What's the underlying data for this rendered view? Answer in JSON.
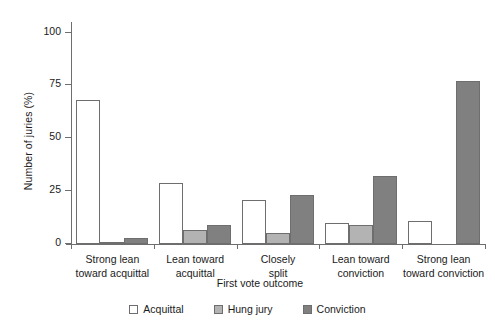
{
  "chart_data": {
    "type": "bar",
    "title": "",
    "xlabel": "First vote outcome",
    "ylabel": "Number of juries (%)",
    "ylim": [
      0,
      105
    ],
    "yticks": [
      0,
      25,
      50,
      75,
      100
    ],
    "ytick_labels": [
      "0",
      "25",
      "50",
      "75",
      "100"
    ],
    "grid": false,
    "legend_position": "bottom-center",
    "categories": [
      "Strong lean\ntoward acquittal",
      "Lean toward\nacquittal",
      "Closely\nsplit",
      "Lean toward\nconviction",
      "Strong lean\ntoward conviction"
    ],
    "category_lines": [
      [
        "Strong lean",
        "toward acquittal"
      ],
      [
        "Lean toward",
        "acquittal"
      ],
      [
        "Closely",
        "split"
      ],
      [
        "Lean toward",
        "conviction"
      ],
      [
        "Strong lean",
        "toward conviction"
      ]
    ],
    "series": [
      {
        "name": "Acquittal",
        "color": "#ffffff",
        "values": [
          68,
          29,
          21,
          10,
          11
        ]
      },
      {
        "name": "Hung jury",
        "color": "#b3b3b3",
        "values": [
          1,
          6.5,
          5,
          9,
          0
        ]
      },
      {
        "name": "Conviction",
        "color": "#808080",
        "values": [
          3,
          9,
          23,
          32,
          77
        ]
      }
    ]
  },
  "colors": {
    "acquittal": "#ffffff",
    "hung_jury": "#b3b3b3",
    "conviction": "#808080",
    "axis": "#6e6e6e",
    "text": "#1a1a1a"
  }
}
